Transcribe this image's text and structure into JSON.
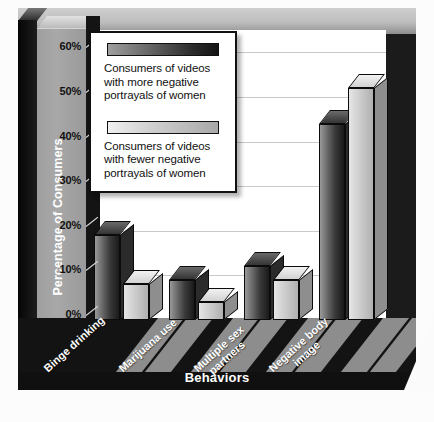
{
  "chart_data": {
    "type": "bar",
    "title": "",
    "xlabel": "Behaviors",
    "ylabel": "Percentage of Consumers",
    "categories": [
      "Binge drinking",
      "Marijuana use",
      "Multiple sex partners",
      "Negative body image"
    ],
    "series": [
      {
        "name": "Consumers of videos with more negative portrayals of women",
        "values": [
          19,
          9,
          12,
          44
        ],
        "color": "#2e2e2e"
      },
      {
        "name": "Consumers of videos with fewer negative portrayals of women",
        "values": [
          8,
          4,
          9,
          52
        ],
        "color": "#cdcdcd"
      }
    ],
    "ylim": [
      0,
      65
    ],
    "yticks": [
      0,
      10,
      20,
      30,
      40,
      50,
      60
    ],
    "ytick_labels": [
      "0%",
      "10%",
      "20%",
      "30%",
      "40%",
      "50%",
      "60%"
    ],
    "grid": true,
    "legend_position": "top-left",
    "style": "3d-bar"
  },
  "axes": {
    "y_title": "Percentage of Consumers",
    "x_title": "Behaviors"
  },
  "legend": {
    "entries": [
      {
        "swatch": "dark-gradient",
        "line1": "Consumers of videos",
        "line2": "with more negative",
        "line3": "portrayals of women"
      },
      {
        "swatch": "light-gradient",
        "line1": "Consumers of videos",
        "line2": "with fewer negative",
        "line3": "portrayals of women"
      }
    ]
  },
  "categories": {
    "cat0_line1": "Binge drinking",
    "cat1_line1": "Marijuana use",
    "cat2_line1": "Multiple sex",
    "cat2_line2": "partners",
    "cat3_line1": "Negative body",
    "cat3_line2": "image"
  },
  "ticks": {
    "t0": "0%",
    "t1": "10%",
    "t2": "20%",
    "t3": "30%",
    "t4": "40%",
    "t5": "50%",
    "t6": "60%"
  }
}
